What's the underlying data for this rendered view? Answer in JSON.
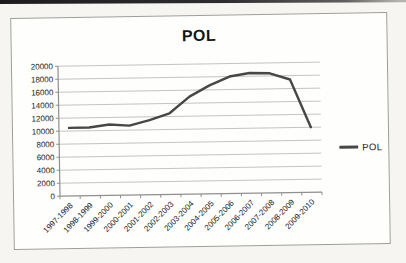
{
  "page": {
    "background": "#f6f5f1",
    "scan_bar_color": "#2a2a2a"
  },
  "chart": {
    "title": "POL",
    "legend_label": "POL"
  },
  "chart_data": {
    "type": "line",
    "title": "POL",
    "categories": [
      "1997-1998",
      "1998-1999",
      "1999-2000",
      "2000-2001",
      "2001-2002",
      "2002-2003",
      "2003-2004",
      "2004-2005",
      "2005-2006",
      "2006-2007",
      "2007-2008",
      "2008-2009",
      "2009-2010"
    ],
    "series": [
      {
        "name": "POL",
        "values": [
          10500,
          10500,
          10900,
          10700,
          11500,
          12500,
          15000,
          16700,
          18000,
          18500,
          18400,
          17400,
          10000
        ]
      }
    ],
    "xlabel": "",
    "ylabel": "",
    "ylim": [
      0,
      20000
    ],
    "yticks": [
      0,
      2000,
      4000,
      6000,
      8000,
      10000,
      12000,
      14000,
      16000,
      18000,
      20000
    ],
    "grid": true,
    "legend_position": "right",
    "style": {
      "line_color": "#474747",
      "grid_color": "#bdbdbd",
      "axis_color": "#8f8f8f",
      "label_color": "#242424"
    }
  }
}
